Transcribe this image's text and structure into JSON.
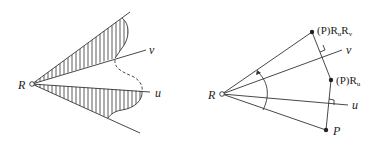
{
  "left_diagram": {
    "origin_label": "R",
    "ray_v_label": "v",
    "ray_u_label": "u"
  },
  "right_diagram": {
    "origin_label": "R",
    "ray_v_label": "v",
    "ray_u_label": "u",
    "point_P_label": "P",
    "point_PRu": {
      "prefix": "(P)",
      "main": "R",
      "sub": "u"
    },
    "point_PRuRv": {
      "prefix": "(P)",
      "main1": "R",
      "sub1": "u",
      "main2": "R",
      "sub2": "v"
    }
  },
  "colors": {
    "line": "#333333",
    "background": "#ffffff"
  }
}
